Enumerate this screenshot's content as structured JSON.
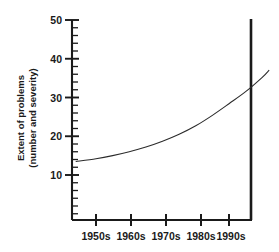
{
  "chart_data": {
    "type": "line",
    "title": "",
    "subtitle": "",
    "xlabel": "",
    "ylabel": "Extent of problems (number and severity)",
    "ylabel_line1": "Extent of problems",
    "ylabel_line2": "(number and severity)",
    "categories": [
      "1950s",
      "1960s",
      "1970s",
      "1980s",
      "1990s"
    ],
    "x_tick_labels": [
      "1950s",
      "1960s",
      "1970s",
      "1980s",
      "1990s"
    ],
    "y_tick_labels": [
      "10",
      "20",
      "30",
      "40",
      "50"
    ],
    "y_ticks": [
      10,
      20,
      30,
      40,
      50
    ],
    "y_minor_tick_step": 2,
    "ylim": [
      4,
      50
    ],
    "xlim": [
      1943,
      2003
    ],
    "grid": false,
    "legend": null,
    "annotations": [],
    "series": [
      {
        "name": "Extent of problems",
        "x": [
          1944,
          1950,
          1955,
          1960,
          1965,
          1970,
          1975,
          1980,
          1985,
          1990,
          1995,
          2000,
          2002
        ],
        "values": [
          13.5,
          14.2,
          15.0,
          16.0,
          17.2,
          18.7,
          20.5,
          22.7,
          25.4,
          28.4,
          31.5,
          35.2,
          37.0
        ]
      }
    ],
    "curve_start_value": 13.5,
    "curve_end_value": 37.0,
    "line_color": "#2b2b2b",
    "axis_color": "#1a1a1a",
    "background_color": "#ffffff"
  }
}
